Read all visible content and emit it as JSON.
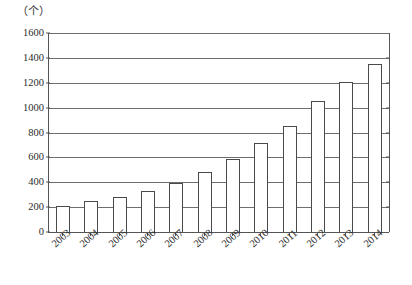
{
  "chart_data": {
    "type": "bar",
    "title": "",
    "subtitle": "",
    "unit_label": "（个）",
    "xlabel": "",
    "ylabel": "",
    "categories": [
      "2003",
      "2004",
      "2005",
      "2006",
      "2007",
      "2008",
      "2009",
      "2010",
      "2011",
      "2012",
      "2013",
      "2014"
    ],
    "values": [
      210,
      250,
      280,
      330,
      395,
      480,
      590,
      715,
      855,
      1050,
      1210,
      1350
    ],
    "ylim": [
      0,
      1600
    ],
    "ytick_labels": [
      "0",
      "200",
      "400",
      "600",
      "800",
      "1000",
      "1200",
      "1400",
      "1600"
    ],
    "ytick_values": [
      0,
      200,
      400,
      600,
      800,
      1000,
      1200,
      1400,
      1600
    ],
    "grid": true,
    "legend": "none",
    "bar_fill_color": "#ffffff",
    "bar_border_color": "#4a4a4a",
    "gridline_color": "#6e6e6e",
    "axis_color": "#555555",
    "background_color": "#ffffff"
  }
}
